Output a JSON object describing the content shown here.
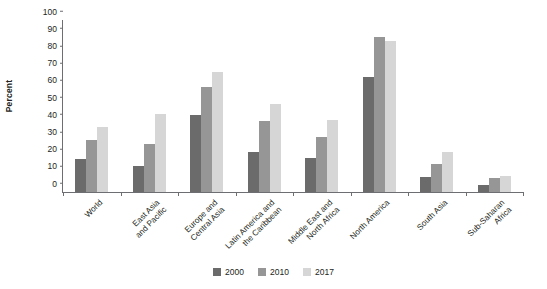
{
  "chart_data": {
    "type": "bar",
    "title": "",
    "xlabel": "",
    "ylabel": "Percent",
    "ylim": [
      0,
      100
    ],
    "yticks": [
      0,
      10,
      20,
      30,
      40,
      50,
      60,
      70,
      80,
      90,
      100
    ],
    "grid": false,
    "legend_position": "bottom-center",
    "categories": [
      "World",
      "East Asia and Pacific",
      "Europe and Central Asia",
      "Latin America and the Caribbean",
      "Middle East and North Africa",
      "North America",
      "South Asia",
      "Sub-Saharan Africa"
    ],
    "category_lines": [
      [
        "World"
      ],
      [
        "East Asia",
        "and Pacific"
      ],
      [
        "Europe and",
        "Central Asia"
      ],
      [
        "Latin America and",
        "the Caribbean"
      ],
      [
        "Middle East and",
        "North Africa"
      ],
      [
        "North America"
      ],
      [
        "South Asia"
      ],
      [
        "Sub-Saharan",
        "Africa"
      ]
    ],
    "series": [
      {
        "name": "2000",
        "color": "#6b6b6b",
        "values": [
          19,
          15,
          45,
          23,
          20,
          67,
          9,
          4
        ]
      },
      {
        "name": "2010",
        "color": "#969696",
        "values": [
          30,
          28,
          61,
          41,
          32,
          90,
          16,
          8
        ]
      },
      {
        "name": "2017",
        "color": "#d6d6d6",
        "values": [
          38,
          45.5,
          70,
          51,
          42,
          88,
          23,
          9.5
        ]
      }
    ]
  },
  "axis": {
    "y_title": "Percent"
  },
  "legend": {
    "items": [
      {
        "label": "2000",
        "color": "#6b6b6b"
      },
      {
        "label": "2010",
        "color": "#969696"
      },
      {
        "label": "2017",
        "color": "#d6d6d6"
      }
    ]
  }
}
